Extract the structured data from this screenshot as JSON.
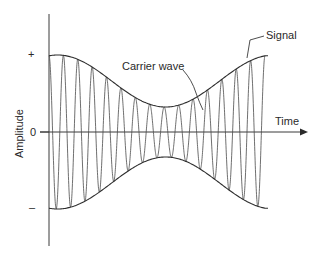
{
  "diagram": {
    "labels": {
      "signal": "Signal",
      "carrier": "Carrier wave",
      "time_axis": "Time",
      "amplitude_axis": "Amplitude"
    },
    "y_ticks": {
      "positive": "+",
      "zero": "0",
      "negative": "–"
    },
    "colors": {
      "line": "#3a3a3a",
      "text": "#2a2a2a",
      "background": "#ffffff"
    },
    "carrier_cycles": 15,
    "envelope_shape": "high at start, dips to minimum near middle, rises to high at end"
  }
}
